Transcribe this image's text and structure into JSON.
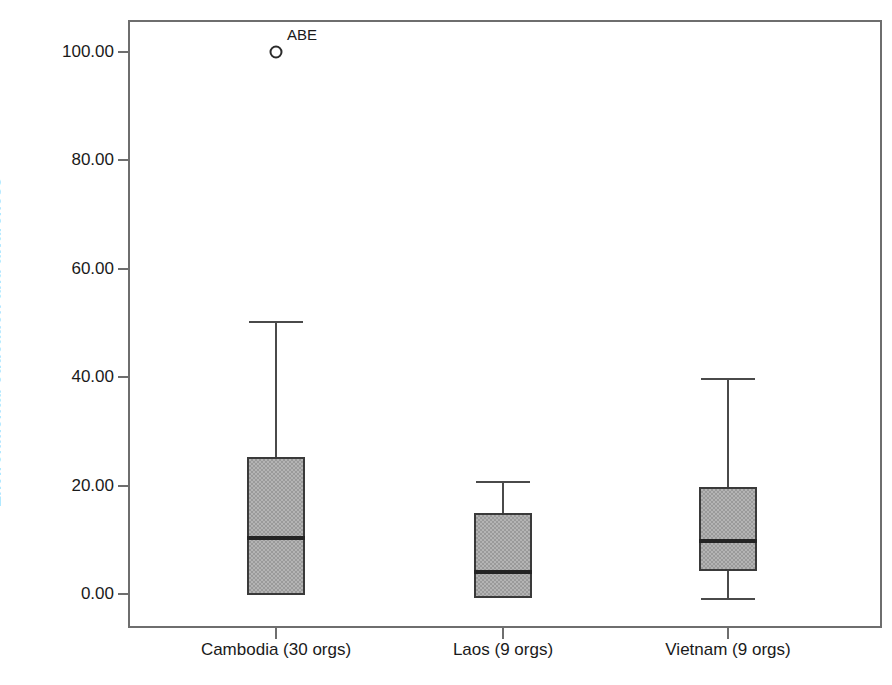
{
  "chart_data": {
    "type": "box",
    "title": "",
    "xlabel": "",
    "ylabel": "Environmental education and awareness",
    "ylim": [
      -5,
      107
    ],
    "yticks": [
      "0.00",
      "20.00",
      "40.00",
      "60.00",
      "80.00",
      "100.00"
    ],
    "ytick_values": [
      0,
      20,
      40,
      60,
      80,
      100
    ],
    "grid": false,
    "legend": false,
    "categories": [
      "Cambodia (30 orgs)",
      "Laos (9 orgs)",
      "Vietnam (9 orgs)"
    ],
    "boxes": [
      {
        "category": "Cambodia (30 orgs)",
        "n": 30,
        "whisker_high": 50.4,
        "q3": 25.3,
        "median": 10.3,
        "q1": -0.2,
        "whisker_low": null,
        "outliers": [
          {
            "label": "ABE",
            "value": 100.0
          }
        ]
      },
      {
        "category": "Laos (9 orgs)",
        "n": 9,
        "whisker_high": 20.8,
        "q3": 14.9,
        "median": 4.1,
        "q1": -0.7,
        "whisker_low": null,
        "outliers": []
      },
      {
        "category": "Vietnam (9 orgs)",
        "n": 9,
        "whisker_high": 39.9,
        "q3": 19.7,
        "median": 9.8,
        "q1": 4.2,
        "whisker_low": -0.7,
        "outliers": []
      }
    ],
    "colors": {
      "box_fill": "#b4b4b4",
      "box_edge": "#3a3a3a",
      "median": "#242424",
      "whisker": "#4a4a4a",
      "frame": "#6e6e6e",
      "text": "#1a1a1a",
      "background": "#ffffff"
    }
  }
}
